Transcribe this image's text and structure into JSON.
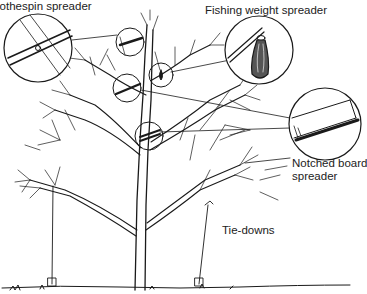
{
  "diagram": {
    "labels": {
      "clothespin": "lothespin spreader",
      "fishing_weight": "Fishing weight spreader",
      "notched_board_line1": "Notched board",
      "notched_board_line2": "spreader",
      "tie_downs": "Tie-downs"
    },
    "callouts": [
      {
        "id": "clothespin-detail",
        "cx": 38,
        "cy": 48,
        "r": 34
      },
      {
        "id": "fishing-weight-detail",
        "cx": 259,
        "cy": 50,
        "r": 34
      },
      {
        "id": "notched-board-detail",
        "cx": 325,
        "cy": 124,
        "r": 36
      }
    ],
    "colors": {
      "ink": "#1a1a1a",
      "background": "#ffffff"
    }
  }
}
